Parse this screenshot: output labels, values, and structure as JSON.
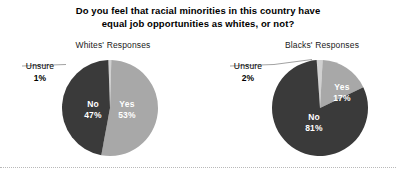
{
  "title": "Do you feel that racial minorities in this country have equal job opportunities as whites, or not?",
  "title_line1": "Do you feel that racial minorities in this country have",
  "title_line2": "equal job opportunities as whites, or not?",
  "colors": {
    "yes": "#a8a8a8",
    "no": "#3a3a3a",
    "unsure": "#d0d0d0",
    "text": "#000000",
    "slice_label": "#ffffff",
    "background": "#ffffff",
    "leader_line": "#8a8a8a",
    "footer_rule": "#b9b9b9"
  },
  "panels": [
    {
      "key": "whites",
      "title": "Whites' Responses",
      "callout_word": "Unsure",
      "callout_pct": "1%",
      "slices": [
        {
          "label": "Yes",
          "value_text": "53%",
          "value": 53
        },
        {
          "label": "No",
          "value_text": "47%",
          "value": 47
        },
        {
          "label": "Unsure",
          "value_text": "1%",
          "value": 1
        }
      ]
    },
    {
      "key": "blacks",
      "title": "Blacks' Responses",
      "callout_word": "Unsure",
      "callout_pct": "2%",
      "slices": [
        {
          "label": "Yes",
          "value_text": "17%",
          "value": 17
        },
        {
          "label": "No",
          "value_text": "81%",
          "value": 81
        },
        {
          "label": "Unsure",
          "value_text": "2%",
          "value": 2
        }
      ]
    }
  ],
  "chart_data": {
    "type": "pie",
    "title": "Do you feel that racial minorities in this country have equal job opportunities as whites, or not?",
    "xlabel": "",
    "ylabel": "",
    "legend_position": "none",
    "grid": false,
    "units": "percent",
    "charts": [
      {
        "title": "Whites' Responses",
        "categories": [
          "Yes",
          "No",
          "Unsure"
        ],
        "values": [
          53,
          47,
          1
        ],
        "labels": [
          "53%",
          "47%",
          "1%"
        ],
        "colors": [
          "#a8a8a8",
          "#3a3a3a",
          "#d0d0d0"
        ],
        "annotations": [
          "Unsure 1%"
        ]
      },
      {
        "title": "Blacks' Responses",
        "categories": [
          "Yes",
          "No",
          "Unsure"
        ],
        "values": [
          17,
          81,
          2
        ],
        "labels": [
          "17%",
          "81%",
          "2%"
        ],
        "colors": [
          "#a8a8a8",
          "#3a3a3a",
          "#d0d0d0"
        ],
        "annotations": [
          "Unsure 2%"
        ]
      }
    ]
  }
}
